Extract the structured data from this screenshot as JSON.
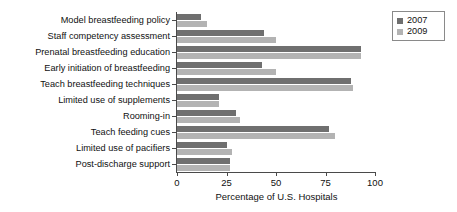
{
  "chart_data": {
    "type": "bar",
    "orientation": "horizontal",
    "title": "",
    "xlabel": "Percentage of U.S. Hospitals",
    "ylabel": "",
    "xlim": [
      0,
      100
    ],
    "xticks": [
      0,
      25,
      50,
      75,
      100
    ],
    "xticklabels": [
      "0",
      "25",
      "50",
      "75",
      "100"
    ],
    "grid": false,
    "legend_position": "top-right",
    "categories": [
      "Model breastfeeding policy",
      "Staff competency assessment",
      "Prenatal breastfeeding education",
      "Early initiation of breastfeeding",
      "Teach breastfeeding techniques",
      "Limited use of supplements",
      "Rooming-in",
      "Teach feeding cues",
      "Limited use of pacifiers",
      "Post-discharge support"
    ],
    "series": [
      {
        "name": "2007",
        "color": "#6f6f6f",
        "values": [
          12,
          44,
          93,
          43,
          88,
          21,
          30,
          77,
          25,
          27
        ]
      },
      {
        "name": "2009",
        "color": "#b3b3b3",
        "values": [
          15,
          50,
          93,
          50,
          89,
          21,
          32,
          80,
          28,
          27
        ]
      }
    ]
  },
  "legend": {
    "entries": [
      {
        "label": "2007"
      },
      {
        "label": "2009"
      }
    ]
  },
  "axis": {
    "x_title": "Percentage of U.S. Hospitals"
  }
}
